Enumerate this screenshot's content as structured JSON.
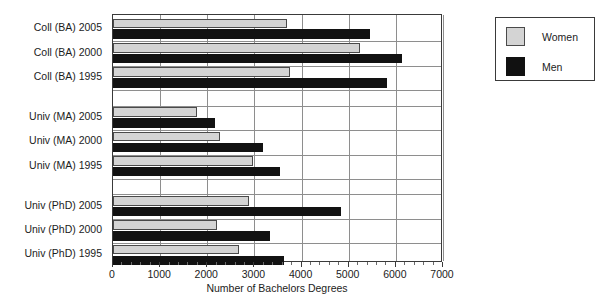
{
  "chart_data": {
    "type": "bar",
    "orientation": "horizontal",
    "title": "",
    "xlabel": "Number of Bachelors Degrees",
    "ylabel": "",
    "xlim": [
      0,
      7000
    ],
    "xticks": [
      0,
      1000,
      2000,
      3000,
      4000,
      5000,
      6000,
      7000
    ],
    "xtick_labels": [
      "0",
      "1000",
      "2000",
      "3000",
      "4000",
      "5000",
      "6000",
      "7000"
    ],
    "grid": true,
    "grid_axis": "both",
    "legend_position": "outside-right-top",
    "categories": [
      "Coll (BA) 2005",
      "Coll (BA) 2000",
      "Coll (BA) 1995",
      "Univ (MA) 2005",
      "Univ (MA) 2000",
      "Univ (MA) 1995",
      "Univ (PhD) 2005",
      "Univ (PhD) 2000",
      "Univ (PhD) 1995"
    ],
    "group_gaps_after": [
      "Coll (BA) 1995",
      "Univ (MA) 1995"
    ],
    "series": [
      {
        "name": "Women",
        "color": "#d4d4d4",
        "values": [
          3690,
          5240,
          3760,
          1790,
          2270,
          2970,
          2890,
          2210,
          2670
        ]
      },
      {
        "name": "Men",
        "color": "#111111",
        "values": [
          5450,
          6130,
          5820,
          2160,
          3180,
          3550,
          4840,
          3340,
          3620
        ]
      }
    ]
  },
  "legend": {
    "items": [
      {
        "label": "Women",
        "swatch": "light-gray-square"
      },
      {
        "label": "Men",
        "swatch": "black-square"
      }
    ]
  },
  "axis": {
    "x_title": "Number of Bachelors Degrees"
  }
}
